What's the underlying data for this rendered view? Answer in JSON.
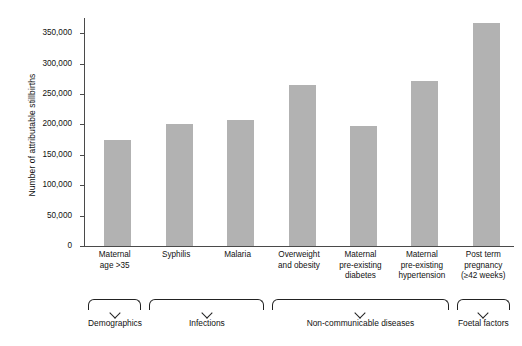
{
  "chart_data": {
    "type": "bar",
    "title": "",
    "xlabel": "",
    "ylabel": "Number of attributable stillbirths",
    "ylim": [
      0,
      375000
    ],
    "grid": false,
    "legend": "none",
    "bar_color": "#b2b2b2",
    "axis_color": "#4a4a4a",
    "ytick_labels": [
      "350,000",
      "300,000",
      "250,000",
      "200,000",
      "150,000",
      "100,000",
      "50,000",
      "0"
    ],
    "ytick_values": [
      350000,
      300000,
      250000,
      200000,
      150000,
      100000,
      50000,
      0
    ],
    "categories": [
      "Maternal age >35",
      "Syphilis",
      "Malaria",
      "Overweight and obesity",
      "Maternal pre-existing diabetes",
      "Maternal pre-existing hypertension",
      "Post term pregnancy (≥42 weeks)"
    ],
    "category_lines": [
      [
        "Maternal",
        "age >35"
      ],
      [
        "Syphilis"
      ],
      [
        "Malaria"
      ],
      [
        "Overweight",
        "and obesity"
      ],
      [
        "Maternal",
        "pre-existing",
        "diabetes"
      ],
      [
        "Maternal",
        "pre-existing",
        "hypertension"
      ],
      [
        "Post term",
        "pregnancy",
        "(≥42 weeks)"
      ]
    ],
    "values": [
      175000,
      200000,
      207000,
      265000,
      197000,
      272000,
      366000
    ],
    "groups": [
      {
        "label": "Demographics",
        "start_index": 0,
        "end_index": 0
      },
      {
        "label": "Infections",
        "start_index": 1,
        "end_index": 2
      },
      {
        "label": "Non-communicable diseases",
        "start_index": 3,
        "end_index": 5
      },
      {
        "label": "Foetal factors",
        "start_index": 6,
        "end_index": 6
      }
    ]
  }
}
